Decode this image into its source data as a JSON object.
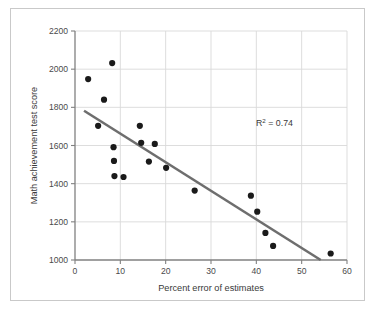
{
  "chart_data": {
    "type": "scatter",
    "title": "",
    "xlabel": "Percent error of estimates",
    "ylabel": "Math achievement test score",
    "xlim": [
      0,
      60
    ],
    "ylim": [
      1000,
      2200
    ],
    "xticks": [
      0,
      10,
      20,
      30,
      40,
      50,
      60
    ],
    "yticks": [
      1000,
      1200,
      1400,
      1600,
      1800,
      2000,
      2200
    ],
    "xtick_labels": [
      "0",
      "10",
      "20",
      "30",
      "40",
      "50",
      "60"
    ],
    "ytick_labels": [
      "1000",
      "1200",
      "1400",
      "1600",
      "1800",
      "2000",
      "2200"
    ],
    "grid": true,
    "grid_color": "#d9d9d9",
    "legend": null,
    "marker_color": "#1a1a1a",
    "marker_size": 3.1,
    "points": [
      {
        "x": 2.9,
        "y": 1948
      },
      {
        "x": 5.1,
        "y": 1703
      },
      {
        "x": 6.4,
        "y": 1840
      },
      {
        "x": 8.2,
        "y": 2032
      },
      {
        "x": 8.5,
        "y": 1591
      },
      {
        "x": 8.6,
        "y": 1519
      },
      {
        "x": 8.7,
        "y": 1440
      },
      {
        "x": 10.7,
        "y": 1435
      },
      {
        "x": 14.3,
        "y": 1703
      },
      {
        "x": 14.6,
        "y": 1614
      },
      {
        "x": 16.3,
        "y": 1516
      },
      {
        "x": 17.6,
        "y": 1608
      },
      {
        "x": 20.1,
        "y": 1483
      },
      {
        "x": 26.4,
        "y": 1364
      },
      {
        "x": 38.8,
        "y": 1337
      },
      {
        "x": 40.2,
        "y": 1253
      },
      {
        "x": 42.0,
        "y": 1142
      },
      {
        "x": 43.7,
        "y": 1074
      },
      {
        "x": 56.4,
        "y": 1034
      }
    ],
    "trendline": {
      "color": "#6e6e6e",
      "width": 2.6,
      "x_start": 2.0,
      "y_start": 1782,
      "x_end": 54.2,
      "y_end": 1000
    },
    "annotations": [
      {
        "name": "r-squared",
        "text_prefix": "R",
        "text_sup": "2",
        "text_suffix": "= 0.74",
        "full_text": "R2 = 0.74",
        "x": 44.0,
        "y": 1700
      }
    ]
  },
  "figure": {
    "background": "#ffffff",
    "border_color": "#c9c9c9",
    "axis_color": "#808080"
  }
}
